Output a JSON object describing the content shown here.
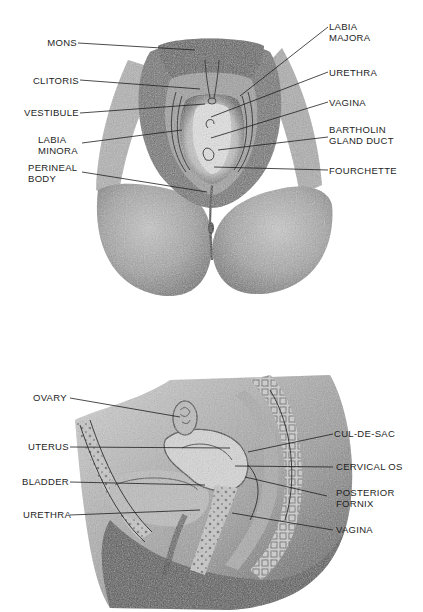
{
  "figure_top": {
    "title": "External female genitalia (perineal view)",
    "labels": {
      "mons": "MONS",
      "clitoris": "CLITORIS",
      "vestibule": "VESTIBULE",
      "labia_minora_1": "LABIA",
      "labia_minora_2": "MINORA",
      "perineal_body_1": "PERINEAL",
      "perineal_body_2": "BODY",
      "labia_majora_1": "LABIA",
      "labia_majora_2": "MAJORA",
      "urethra": "URETHRA",
      "vagina": "VAGINA",
      "bartholin_1": "BARTHOLIN",
      "bartholin_2": "GLAND DUCT",
      "fourchette": "FOURCHETTE"
    }
  },
  "figure_bottom": {
    "title": "Sagittal section of female pelvis",
    "labels": {
      "ovary": "OVARY",
      "uterus": "UTERUS",
      "bladder": "BLADDER",
      "urethra": "URETHRA",
      "cul_de_sac": "CUL-DE-SAC",
      "cervical_os": "CERVICAL OS",
      "posterior_fornix_1": "POSTERIOR",
      "posterior_fornix_2": "FORNIX",
      "vagina": "VAGINA"
    }
  },
  "colors": {
    "ink": "#1e1e1e",
    "pencil_dark": "#3a3a3a",
    "pencil_mid": "#7a7a7a",
    "pencil_light": "#b8b8b8",
    "paper": "#ffffff"
  }
}
